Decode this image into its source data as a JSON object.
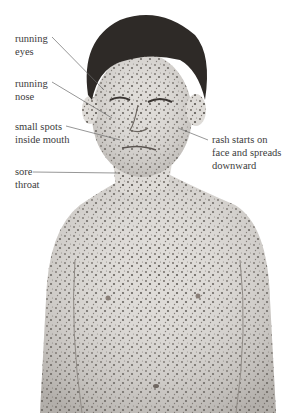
{
  "diagram": {
    "labels": [
      {
        "id": "running-eyes",
        "line1": "running",
        "line2": "eyes"
      },
      {
        "id": "running-nose",
        "line1": "running",
        "line2": "nose"
      },
      {
        "id": "small-spots",
        "line1": "small spots",
        "line2": "inside mouth"
      },
      {
        "id": "sore-throat",
        "line1": "sore",
        "line2": "throat"
      },
      {
        "id": "rash",
        "line1": "rash starts on",
        "line2": "face and spreads",
        "line3": "downward"
      }
    ],
    "colors": {
      "skin": "#d9d6d2",
      "spots": "#5a5550",
      "hair": "#2b2826",
      "line": "#6a6a6a"
    }
  }
}
